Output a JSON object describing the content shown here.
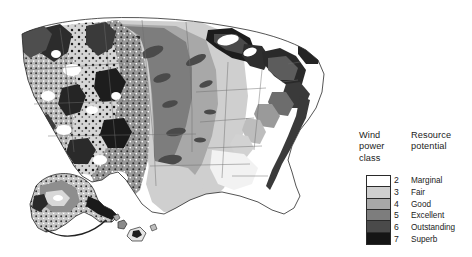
{
  "figure": {
    "background_color": "#ffffff"
  },
  "map": {
    "name": "united-states-wind-power-class-map",
    "regions": [
      "contiguous-united-states",
      "alaska-inset",
      "hawaii-inset"
    ],
    "outline_color": "#2a2a2a",
    "description": "Shaded contour map of wind power class across the United States"
  },
  "legend": {
    "heading_class": "Wind\npower\nclass",
    "heading_potential": "Resource\npotential",
    "entries": [
      {
        "class": "2",
        "potential": "Marginal",
        "color": "#ffffff"
      },
      {
        "class": "3",
        "potential": "Fair",
        "color": "#cfcfcf"
      },
      {
        "class": "4",
        "potential": "Good",
        "color": "#a8a8a8"
      },
      {
        "class": "5",
        "potential": "Excellent",
        "color": "#7d7d7d"
      },
      {
        "class": "6",
        "potential": "Outstanding",
        "color": "#4a4a4a"
      },
      {
        "class": "7",
        "potential": "Superb",
        "color": "#151515"
      }
    ]
  },
  "chart_data": {
    "type": "map",
    "classification": "choropleth-contour",
    "categories": [
      "2",
      "3",
      "4",
      "5",
      "6",
      "7"
    ],
    "category_labels": [
      "Marginal",
      "Fair",
      "Good",
      "Excellent",
      "Outstanding",
      "Superb"
    ],
    "colors": [
      "#ffffff",
      "#cfcfcf",
      "#a8a8a8",
      "#7d7d7d",
      "#4a4a4a",
      "#151515"
    ],
    "legend_position": "right",
    "grid": false
  }
}
